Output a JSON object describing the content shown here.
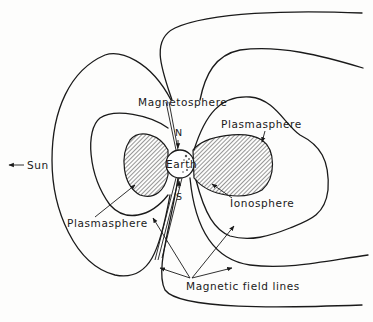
{
  "figure": {
    "type": "magnetosphere-schematic",
    "labels": {
      "sun": "Sun",
      "sun_arrow": "←",
      "magnetosphere": "Magnetosphere",
      "plasmasphere_right": "Plasmasphere",
      "plasmasphere_left": "Plasmasphere",
      "earth": "Earth",
      "north": "N",
      "south": "S",
      "ionosphere": "Ionosphere",
      "magnetic_field_lines": "Magnetic field lines"
    },
    "colors": {
      "ink": "#1a1a1a",
      "background": "#fdfdfc"
    }
  }
}
